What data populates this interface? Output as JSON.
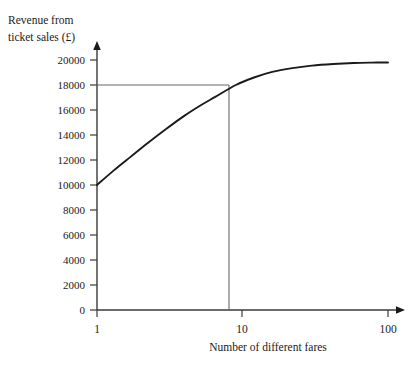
{
  "chart_data": {
    "type": "line",
    "title": "",
    "ylabel_line1": "Revenue from",
    "ylabel_line2": "ticket sales (£)",
    "xlabel": "Number of different fares",
    "x_scale": "log",
    "xlim": [
      1,
      100
    ],
    "ylim": [
      0,
      21000
    ],
    "grid": false,
    "legend": "none",
    "x_ticks": [
      1,
      10,
      100
    ],
    "x_tick_labels": [
      "1",
      "10",
      "100"
    ],
    "y_ticks": [
      0,
      2000,
      4000,
      6000,
      8000,
      10000,
      12000,
      14000,
      16000,
      18000,
      20000
    ],
    "y_tick_labels": [
      "0",
      "2000",
      "4000",
      "6000",
      "8000",
      "10000",
      "12000",
      "14000",
      "16000",
      "18000",
      "20000"
    ],
    "series": [
      {
        "name": "Revenue curve",
        "x": [
          1,
          1.3,
          1.7,
          2.2,
          3,
          4,
          5.2,
          6.5,
          9,
          12,
          16,
          22,
          30,
          42,
          58,
          78,
          100
        ],
        "values": [
          10000,
          11150,
          12250,
          13300,
          14500,
          15550,
          16400,
          17050,
          18000,
          18600,
          19050,
          19350,
          19550,
          19680,
          19760,
          19790,
          19800
        ]
      }
    ],
    "reference_lines": [
      {
        "name": "revenue-reference-line",
        "orientation": "horizontal",
        "value": 18000,
        "label": "18000"
      },
      {
        "name": "fares-reference-line",
        "orientation": "vertical",
        "value": 9,
        "label": "9"
      }
    ],
    "annotations": []
  },
  "axis": {
    "y_title_line1": "Revenue from",
    "y_title_line2": "ticket sales (£)",
    "x_title": "Number of different fares"
  },
  "colors": {
    "background": "#ffffff",
    "curve": "#1a1a1a",
    "axis": "#3a3a3a",
    "reference_line": "#666666",
    "text": "#1a1a1a"
  }
}
